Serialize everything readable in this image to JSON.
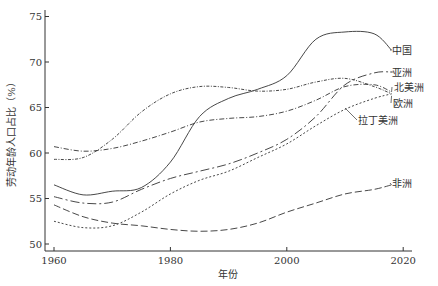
{
  "chart_data": {
    "type": "line",
    "title": "",
    "xlabel": "年份",
    "ylabel": "劳动年龄人口占比（%）",
    "xlim": [
      1960,
      2020
    ],
    "ylim": [
      50,
      75
    ],
    "xticks": [
      1960,
      1980,
      2000,
      2020
    ],
    "yticks": [
      50,
      55,
      60,
      65,
      70,
      75
    ],
    "grid": false,
    "legend_position": "inline-right",
    "x": [
      1960,
      1965,
      1970,
      1975,
      1980,
      1985,
      1990,
      1995,
      2000,
      2005,
      2010,
      2015,
      2018
    ],
    "series": [
      {
        "name": "中国",
        "style": "solid",
        "values": [
          56.5,
          55.4,
          55.8,
          56.2,
          59.0,
          64.0,
          66.0,
          67.0,
          68.5,
          72.5,
          73.3,
          73.1,
          71.3
        ]
      },
      {
        "name": "亚洲",
        "style": "dashdot-long",
        "values": [
          55.2,
          54.5,
          54.6,
          56.0,
          57.2,
          58.0,
          58.8,
          60.0,
          61.5,
          64.0,
          67.5,
          68.8,
          68.9
        ]
      },
      {
        "name": "北美洲",
        "style": "dashdot",
        "values": [
          60.7,
          60.2,
          60.5,
          61.3,
          62.3,
          63.4,
          63.8,
          64.0,
          64.6,
          65.8,
          67.3,
          67.5,
          66.7
        ]
      },
      {
        "name": "欧洲",
        "style": "dashdot-dense",
        "values": [
          59.3,
          59.5,
          61.5,
          64.5,
          66.5,
          67.3,
          67.2,
          66.8,
          67.0,
          67.8,
          68.2,
          67.3,
          66.5
        ]
      },
      {
        "name": "拉丁美洲",
        "style": "dotted",
        "values": [
          52.5,
          51.8,
          52.0,
          53.5,
          55.5,
          57.0,
          58.0,
          59.5,
          61.0,
          63.0,
          64.8,
          66.0,
          66.5
        ]
      },
      {
        "name": "非洲",
        "style": "dashed",
        "values": [
          54.3,
          53.0,
          52.3,
          52.0,
          51.6,
          51.4,
          51.6,
          52.3,
          53.5,
          54.5,
          55.5,
          56.0,
          56.5
        ]
      }
    ]
  }
}
